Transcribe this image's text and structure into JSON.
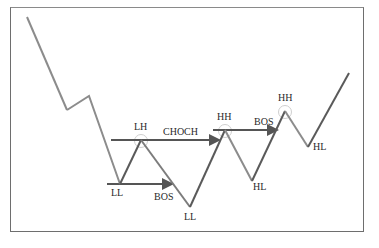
{
  "diagram": {
    "colors": {
      "zigzag_down": "#8c8c8c",
      "zigzag_up": "#5a5a5a",
      "level_line": "#555555",
      "circle": "#c8c8c8",
      "frame": "#6e6e6e",
      "text": "#2a2a2a"
    },
    "labels": {
      "ll1": "LL",
      "lh": "LH",
      "bos1": "BOS",
      "ll2": "LL",
      "choch": "CHOCH",
      "hh1": "HH",
      "hl1": "HL",
      "bos2": "BOS",
      "hh2": "HH",
      "hl2": "HL"
    },
    "swing_points": [
      {
        "label": "start",
        "x": 27,
        "y": 17
      },
      {
        "label": "",
        "x": 67,
        "y": 110
      },
      {
        "label": "",
        "x": 89,
        "y": 96
      },
      {
        "label": "LL",
        "x": 120,
        "y": 184
      },
      {
        "label": "LH",
        "x": 141,
        "y": 140
      },
      {
        "label": "LL",
        "x": 190,
        "y": 207
      },
      {
        "label": "HH",
        "x": 225,
        "y": 130
      },
      {
        "label": "HL",
        "x": 252,
        "y": 181
      },
      {
        "label": "HH",
        "x": 285,
        "y": 111
      },
      {
        "label": "HL",
        "x": 308,
        "y": 147
      },
      {
        "label": "end",
        "x": 349,
        "y": 73
      }
    ]
  }
}
